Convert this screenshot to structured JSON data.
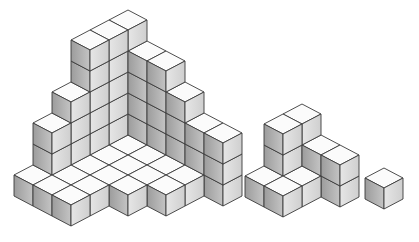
{
  "figure": {
    "colors": {
      "background": "#ffffff",
      "top_face": "#fbfbfb",
      "left_face_light": "#c4c4c4",
      "left_face_dark": "#9c9c9c",
      "right_face_light": "#e6e6e6",
      "right_face_dark": "#cfcfcf",
      "edge": "#3a3a3a"
    },
    "projection": {
      "half_width": 19,
      "half_height": 10,
      "cube_height": 21
    },
    "structures": [
      {
        "name": "large-corner-structure",
        "origin": [
          128,
          156
        ],
        "columns": [
          [
            -1,
            -1,
            6
          ],
          [
            -1,
            0,
            6
          ],
          [
            -1,
            1,
            6
          ],
          [
            -1,
            2,
            4
          ],
          [
            -1,
            3,
            3
          ],
          [
            -1,
            4,
            1
          ],
          [
            0,
            -1,
            5
          ],
          [
            1,
            -1,
            5
          ],
          [
            2,
            -1,
            4
          ],
          [
            3,
            -1,
            3
          ],
          [
            4,
            -1,
            3
          ],
          [
            0,
            0,
            1
          ],
          [
            1,
            0,
            1
          ],
          [
            2,
            0,
            1
          ],
          [
            3,
            0,
            1
          ],
          [
            0,
            1,
            1
          ],
          [
            1,
            1,
            1
          ],
          [
            2,
            1,
            1
          ],
          [
            3,
            1,
            1
          ],
          [
            0,
            2,
            1
          ],
          [
            1,
            2,
            1
          ],
          [
            2,
            2,
            1
          ],
          [
            0,
            3,
            1
          ],
          [
            1,
            3,
            1
          ],
          [
            0,
            4,
            1
          ],
          [
            1,
            4,
            1
          ]
        ]
      },
      {
        "name": "medium-step-structure",
        "origin": [
          302,
          167
        ],
        "columns": [
          [
            0,
            0,
            3
          ],
          [
            0,
            1,
            3
          ],
          [
            1,
            0,
            2
          ],
          [
            2,
            0,
            2
          ],
          [
            1,
            1,
            1
          ],
          [
            0,
            2,
            1
          ],
          [
            1,
            2,
            1
          ]
        ]
      },
      {
        "name": "single-cube",
        "origin": [
          384,
          189
        ],
        "columns": [
          [
            0,
            0,
            1
          ]
        ]
      }
    ]
  }
}
